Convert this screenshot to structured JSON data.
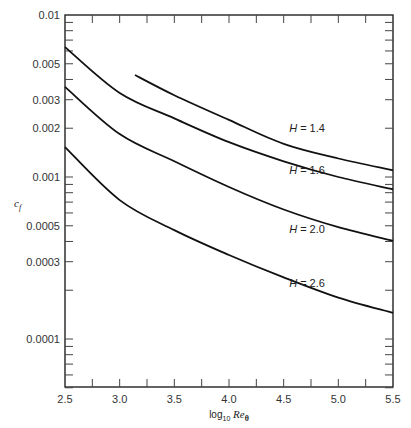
{
  "chart_data": {
    "type": "line",
    "title": "",
    "xlabel": "log10 Re_θ",
    "xlabel_parts": {
      "base": "log",
      "sub": "10",
      "var": "Re",
      "var_sub": "θ"
    },
    "ylabel": "c_f",
    "ylabel_parts": {
      "var": "c",
      "sub": "f"
    },
    "xlim": [
      2.5,
      5.5
    ],
    "ylim": [
      5e-05,
      0.01
    ],
    "yscale": "log",
    "grid": false,
    "legend": "inline labels",
    "x_ticks": [
      2.5,
      3.0,
      3.5,
      4.0,
      4.5,
      5.0,
      5.5
    ],
    "x_tick_labels": [
      "2.5",
      "3.0",
      "3.5",
      "4.0",
      "4.5",
      "5.0",
      "5.5"
    ],
    "y_ticks": [
      0.01,
      0.005,
      0.003,
      0.002,
      0.001,
      0.0005,
      0.0003,
      0.0001
    ],
    "y_tick_labels": [
      "0.01",
      "0.005",
      "0.003",
      "0.002",
      "0.001",
      "0.0005",
      "0.0003",
      "0.0001"
    ],
    "series": [
      {
        "name": "H = 1.4",
        "label_pos": [
          4.55,
          0.0019
        ],
        "x": [
          3.14,
          3.5,
          4.0,
          4.5,
          5.0,
          5.5
        ],
        "y": [
          0.00426,
          0.0032,
          0.00225,
          0.0016,
          0.0013,
          0.0011
        ]
      },
      {
        "name": "H = 1.6",
        "label_pos": [
          4.55,
          0.00105
        ],
        "x": [
          2.5,
          3.0,
          3.5,
          4.0,
          4.5,
          5.0,
          5.5
        ],
        "y": [
          0.00634,
          0.0033,
          0.0023,
          0.00164,
          0.00125,
          0.001,
          0.00084
        ]
      },
      {
        "name": "H = 2.0",
        "label_pos": [
          4.55,
          0.00045
        ],
        "x": [
          2.5,
          3.0,
          3.5,
          4.0,
          4.5,
          5.0,
          5.5
        ],
        "y": [
          0.0036,
          0.00184,
          0.00125,
          0.000867,
          0.00063,
          0.00049,
          0.000403
        ]
      },
      {
        "name": "H = 2.6",
        "label_pos": [
          4.55,
          0.00021
        ],
        "x": [
          2.5,
          3.0,
          3.5,
          4.0,
          4.5,
          5.0,
          5.5
        ],
        "y": [
          0.00153,
          0.00072,
          0.00047,
          0.00033,
          0.00024,
          0.00018,
          0.000145
        ]
      }
    ]
  },
  "labels": {
    "H": "H",
    "eq": " = ",
    "values": [
      "1.4",
      "1.6",
      "2.0",
      "2.6"
    ]
  }
}
